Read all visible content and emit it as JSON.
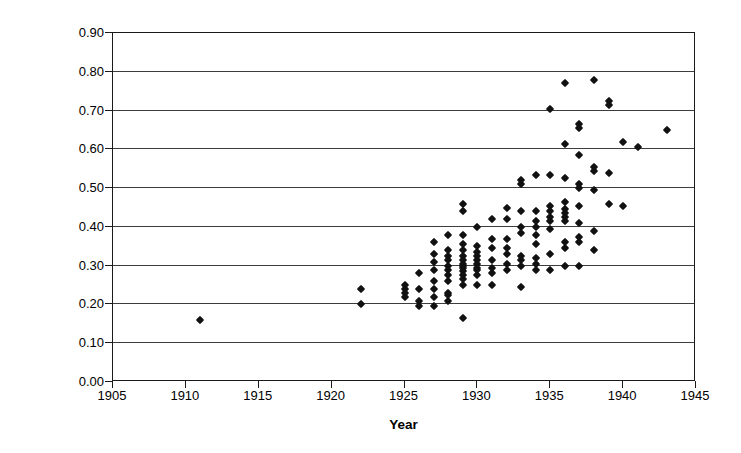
{
  "chart_data": {
    "type": "scatter",
    "title": "",
    "xlabel": "Year",
    "ylabel": "HP/cubic inch",
    "xlim": [
      1905,
      1945
    ],
    "ylim": [
      0.0,
      0.9
    ],
    "xticks": [
      1905,
      1910,
      1915,
      1920,
      1925,
      1930,
      1935,
      1940,
      1945
    ],
    "xtick_labels": [
      "1905",
      "1910",
      "1915",
      "1920",
      "1925",
      "1930",
      "1935",
      "1940",
      "1945"
    ],
    "yticks": [
      0.0,
      0.1,
      0.2,
      0.3,
      0.4,
      0.5,
      0.6,
      0.7,
      0.8,
      0.9
    ],
    "ytick_labels": [
      "0.00",
      "0.10",
      "0.20",
      "0.30",
      "0.40",
      "0.50",
      "0.60",
      "0.70",
      "0.80",
      "0.90"
    ],
    "grid": "horizontal",
    "legend": "none",
    "marker": "diamond",
    "marker_color": "#111111",
    "points": [
      [
        1911,
        0.16
      ],
      [
        1922,
        0.24
      ],
      [
        1922,
        0.2
      ],
      [
        1925,
        0.25
      ],
      [
        1925,
        0.24
      ],
      [
        1925,
        0.23
      ],
      [
        1925,
        0.22
      ],
      [
        1926,
        0.28
      ],
      [
        1926,
        0.24
      ],
      [
        1926,
        0.21
      ],
      [
        1926,
        0.195
      ],
      [
        1927,
        0.36
      ],
      [
        1927,
        0.33
      ],
      [
        1927,
        0.31
      ],
      [
        1927,
        0.29
      ],
      [
        1927,
        0.26
      ],
      [
        1927,
        0.24
      ],
      [
        1927,
        0.22
      ],
      [
        1927,
        0.195
      ],
      [
        1928,
        0.38
      ],
      [
        1928,
        0.34
      ],
      [
        1928,
        0.325
      ],
      [
        1928,
        0.315
      ],
      [
        1928,
        0.3
      ],
      [
        1928,
        0.29
      ],
      [
        1928,
        0.275
      ],
      [
        1928,
        0.26
      ],
      [
        1928,
        0.23
      ],
      [
        1928,
        0.225
      ],
      [
        1928,
        0.21
      ],
      [
        1929,
        0.46
      ],
      [
        1929,
        0.44
      ],
      [
        1929,
        0.38
      ],
      [
        1929,
        0.355
      ],
      [
        1929,
        0.34
      ],
      [
        1929,
        0.325
      ],
      [
        1929,
        0.315
      ],
      [
        1929,
        0.305
      ],
      [
        1929,
        0.3
      ],
      [
        1929,
        0.295
      ],
      [
        1929,
        0.285
      ],
      [
        1929,
        0.275
      ],
      [
        1929,
        0.265
      ],
      [
        1929,
        0.25
      ],
      [
        1929,
        0.165
      ],
      [
        1930,
        0.4
      ],
      [
        1930,
        0.35
      ],
      [
        1930,
        0.335
      ],
      [
        1930,
        0.325
      ],
      [
        1930,
        0.315
      ],
      [
        1930,
        0.305
      ],
      [
        1930,
        0.295
      ],
      [
        1930,
        0.29
      ],
      [
        1930,
        0.275
      ],
      [
        1930,
        0.25
      ],
      [
        1931,
        0.42
      ],
      [
        1931,
        0.37
      ],
      [
        1931,
        0.345
      ],
      [
        1931,
        0.315
      ],
      [
        1931,
        0.295
      ],
      [
        1931,
        0.28
      ],
      [
        1931,
        0.25
      ],
      [
        1932,
        0.45
      ],
      [
        1932,
        0.42
      ],
      [
        1932,
        0.37
      ],
      [
        1932,
        0.345
      ],
      [
        1932,
        0.33
      ],
      [
        1932,
        0.305
      ],
      [
        1932,
        0.29
      ],
      [
        1933,
        0.52
      ],
      [
        1933,
        0.51
      ],
      [
        1933,
        0.44
      ],
      [
        1933,
        0.4
      ],
      [
        1933,
        0.385
      ],
      [
        1933,
        0.325
      ],
      [
        1933,
        0.315
      ],
      [
        1933,
        0.3
      ],
      [
        1933,
        0.245
      ],
      [
        1934,
        0.535
      ],
      [
        1934,
        0.44
      ],
      [
        1934,
        0.415
      ],
      [
        1934,
        0.4
      ],
      [
        1934,
        0.38
      ],
      [
        1934,
        0.355
      ],
      [
        1934,
        0.32
      ],
      [
        1934,
        0.305
      ],
      [
        1934,
        0.29
      ],
      [
        1935,
        0.705
      ],
      [
        1935,
        0.535
      ],
      [
        1935,
        0.455
      ],
      [
        1935,
        0.44
      ],
      [
        1935,
        0.425
      ],
      [
        1935,
        0.415
      ],
      [
        1935,
        0.395
      ],
      [
        1935,
        0.33
      ],
      [
        1935,
        0.29
      ],
      [
        1936,
        0.77
      ],
      [
        1936,
        0.615
      ],
      [
        1936,
        0.525
      ],
      [
        1936,
        0.465
      ],
      [
        1936,
        0.445
      ],
      [
        1936,
        0.435
      ],
      [
        1936,
        0.425
      ],
      [
        1936,
        0.415
      ],
      [
        1936,
        0.36
      ],
      [
        1936,
        0.345
      ],
      [
        1936,
        0.3
      ],
      [
        1937,
        0.665
      ],
      [
        1937,
        0.655
      ],
      [
        1937,
        0.585
      ],
      [
        1937,
        0.51
      ],
      [
        1937,
        0.5
      ],
      [
        1937,
        0.455
      ],
      [
        1937,
        0.41
      ],
      [
        1937,
        0.375
      ],
      [
        1937,
        0.36
      ],
      [
        1937,
        0.3
      ],
      [
        1938,
        0.78
      ],
      [
        1938,
        0.555
      ],
      [
        1938,
        0.545
      ],
      [
        1938,
        0.495
      ],
      [
        1938,
        0.39
      ],
      [
        1938,
        0.34
      ],
      [
        1939,
        0.725
      ],
      [
        1939,
        0.715
      ],
      [
        1939,
        0.54
      ],
      [
        1939,
        0.46
      ],
      [
        1940,
        0.62
      ],
      [
        1940,
        0.455
      ],
      [
        1941,
        0.605
      ],
      [
        1943,
        0.65
      ]
    ]
  }
}
